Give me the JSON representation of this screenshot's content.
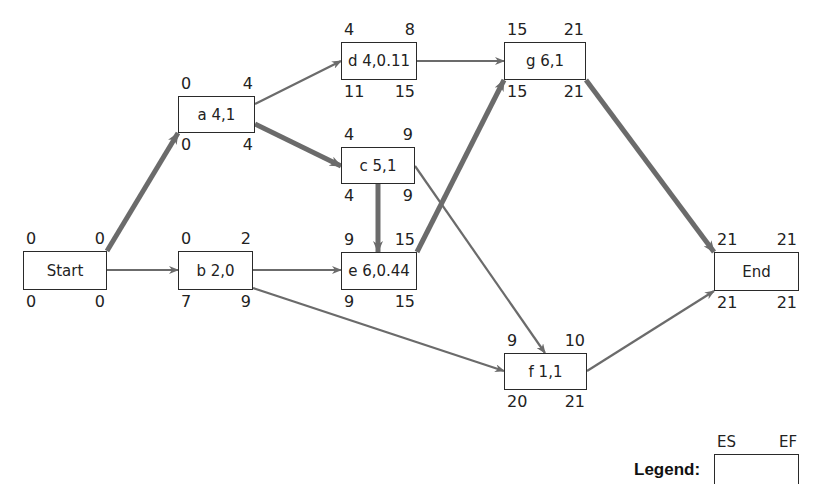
{
  "diagram": {
    "type": "activity-on-node network (CPM/PERT)",
    "colors": {
      "edge": "#6b6b6b",
      "critical_edge": "#6b6b6b",
      "box_border": "#2a2a2a",
      "text": "#222222"
    },
    "nodes": [
      {
        "id": "start",
        "label": "Start",
        "es": "0",
        "ef": "0",
        "ls": "0",
        "lf": "0",
        "x": 23,
        "y": 251,
        "w": 84,
        "h": 39
      },
      {
        "id": "a",
        "label": "a 4,1",
        "es": "0",
        "ef": "4",
        "ls": "0",
        "lf": "4",
        "x": 178,
        "y": 96,
        "w": 77,
        "h": 37
      },
      {
        "id": "b",
        "label": "b 2,0",
        "es": "0",
        "ef": "2",
        "ls": "7",
        "lf": "9",
        "x": 178,
        "y": 251,
        "w": 75,
        "h": 39
      },
      {
        "id": "d",
        "label": "d 4,0.11",
        "es": "4",
        "ef": "8",
        "ls": "11",
        "lf": "15",
        "x": 341,
        "y": 42,
        "w": 76,
        "h": 38
      },
      {
        "id": "c",
        "label": "c 5,1",
        "es": "4",
        "ef": "9",
        "ls": "4",
        "lf": "9",
        "x": 341,
        "y": 147,
        "w": 74,
        "h": 37
      },
      {
        "id": "e",
        "label": "e 6,0.44",
        "es": "9",
        "ef": "15",
        "ls": "9",
        "lf": "15",
        "x": 341,
        "y": 252,
        "w": 76,
        "h": 38
      },
      {
        "id": "g",
        "label": "g 6,1",
        "es": "15",
        "ef": "21",
        "ls": "15",
        "lf": "21",
        "x": 504,
        "y": 42,
        "w": 82,
        "h": 38
      },
      {
        "id": "f",
        "label": "f 1,1",
        "es": "9",
        "ef": "10",
        "ls": "20",
        "lf": "21",
        "x": 504,
        "y": 353,
        "w": 83,
        "h": 37
      },
      {
        "id": "end",
        "label": "End",
        "es": "21",
        "ef": "21",
        "ls": "21",
        "lf": "21",
        "x": 714,
        "y": 252,
        "w": 85,
        "h": 39
      }
    ],
    "edges": [
      {
        "from": "start",
        "to": "a",
        "critical": true
      },
      {
        "from": "start",
        "to": "b",
        "critical": false
      },
      {
        "from": "a",
        "to": "d",
        "critical": false
      },
      {
        "from": "a",
        "to": "c",
        "critical": true
      },
      {
        "from": "b",
        "to": "e",
        "critical": false
      },
      {
        "from": "b",
        "to": "f",
        "critical": false
      },
      {
        "from": "d",
        "to": "g",
        "critical": false
      },
      {
        "from": "c",
        "to": "e",
        "critical": true
      },
      {
        "from": "c",
        "to": "f",
        "critical": false
      },
      {
        "from": "e",
        "to": "g",
        "critical": true
      },
      {
        "from": "g",
        "to": "end",
        "critical": true
      },
      {
        "from": "f",
        "to": "end",
        "critical": false
      }
    ],
    "legend": {
      "title": "Legend:",
      "es_label": "ES",
      "ef_label": "EF"
    }
  }
}
